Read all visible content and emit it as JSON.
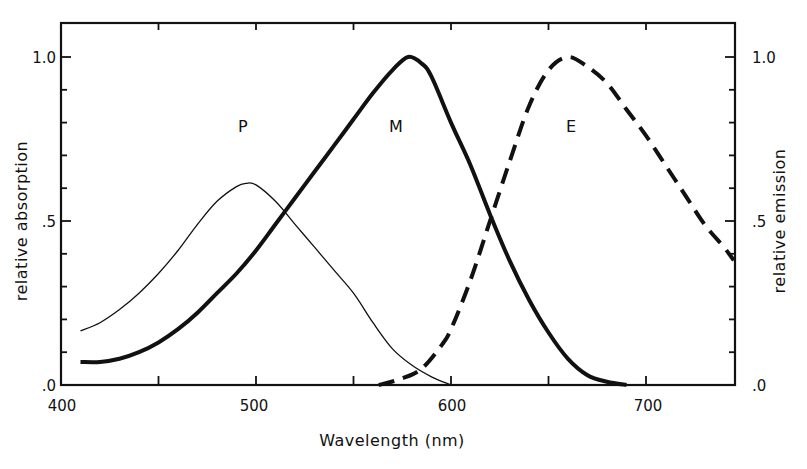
{
  "chart_data": {
    "type": "line",
    "title": "",
    "xlabel": "Wavelength (nm)",
    "ylabel": "relative absorption",
    "ylabel_right": "relative emission",
    "xlim": [
      400,
      745
    ],
    "ylim": [
      0,
      1.1
    ],
    "x_ticks": [
      400,
      500,
      600,
      700
    ],
    "x_minor_ticks": [
      450,
      550,
      650
    ],
    "x_tick_labels": [
      "400",
      "500",
      "600",
      "700"
    ],
    "y_ticks": [
      0.0,
      0.5,
      1.0
    ],
    "y_tick_labels_left": [
      ".0",
      ".5",
      "1.0"
    ],
    "y_tick_labels_right": [
      ".0",
      ".5",
      "1.0"
    ],
    "y_minor_step": 0.1,
    "grid": false,
    "legend": "none (curves labelled inline)",
    "series": [
      {
        "name": "P",
        "style": "thin solid",
        "axis": "left",
        "x": [
          410,
          420,
          430,
          440,
          450,
          460,
          470,
          480,
          490,
          495,
          500,
          510,
          520,
          530,
          540,
          550,
          560,
          570,
          580,
          590,
          600
        ],
        "values": [
          0.165,
          0.19,
          0.23,
          0.28,
          0.34,
          0.41,
          0.49,
          0.56,
          0.605,
          0.615,
          0.61,
          0.56,
          0.49,
          0.42,
          0.35,
          0.28,
          0.19,
          0.11,
          0.06,
          0.025,
          0.0
        ]
      },
      {
        "name": "M",
        "style": "thick solid",
        "axis": "left",
        "x": [
          410,
          420,
          430,
          440,
          450,
          460,
          470,
          480,
          490,
          500,
          510,
          520,
          530,
          540,
          550,
          560,
          570,
          578,
          585,
          590,
          600,
          610,
          620,
          630,
          640,
          650,
          660,
          670,
          680,
          690
        ],
        "values": [
          0.07,
          0.07,
          0.08,
          0.1,
          0.13,
          0.17,
          0.22,
          0.28,
          0.34,
          0.41,
          0.49,
          0.57,
          0.65,
          0.73,
          0.81,
          0.89,
          0.96,
          1.0,
          0.98,
          0.94,
          0.8,
          0.67,
          0.52,
          0.38,
          0.26,
          0.16,
          0.08,
          0.03,
          0.01,
          0.0
        ]
      },
      {
        "name": "E",
        "style": "thick dashed",
        "axis": "right",
        "x": [
          563,
          575,
          585,
          595,
          600,
          610,
          620,
          630,
          640,
          650,
          660,
          670,
          680,
          690,
          700,
          710,
          720,
          730,
          740,
          745
        ],
        "values": [
          0.0,
          0.02,
          0.05,
          0.12,
          0.17,
          0.32,
          0.5,
          0.68,
          0.85,
          0.96,
          1.0,
          0.97,
          0.92,
          0.84,
          0.76,
          0.67,
          0.58,
          0.49,
          0.42,
          0.38
        ]
      }
    ],
    "annotations": [
      {
        "text": "P",
        "x": 495,
        "y": 0.78
      },
      {
        "text": "M",
        "x": 572,
        "y": 0.78
      },
      {
        "text": "E",
        "x": 660,
        "y": 0.78
      }
    ]
  },
  "labels": {
    "xlabel": "Wavelength (nm)",
    "ylabel_left": "relative absorption",
    "ylabel_right": "relative emission",
    "x_tick_400": "400",
    "x_tick_500": "500",
    "x_tick_600": "600",
    "x_tick_700": "700",
    "y_left_0": ".0",
    "y_left_05": ".5",
    "y_left_1": "1.0",
    "y_right_0": ".0",
    "y_right_05": ".5",
    "y_right_1": "1.0",
    "curve_p": "P",
    "curve_m": "M",
    "curve_e": "E"
  },
  "colors": {
    "ink": "#111111",
    "background": "#ffffff"
  }
}
